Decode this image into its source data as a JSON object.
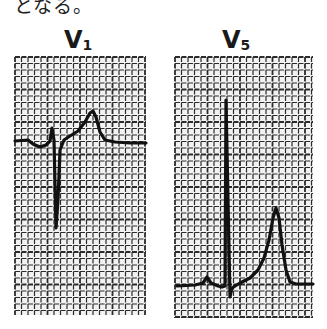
{
  "caption_fragment": "となる。",
  "panels": [
    {
      "lead": "V",
      "lead_sub": "1",
      "grid": {
        "x": 15,
        "y": 57,
        "width": 131,
        "height": 258,
        "spacing": 6.5
      },
      "trace_points": "15,141 28,140 33,144 40,147 46,145 50,141 52,128 54,140 56,228 58,200 60,150 64,140 70,136 78,131 85,122 90,113 93,111 96,117 100,132 105,140 115,142 130,143 146,143"
    },
    {
      "lead": "V",
      "lead_sub": "5",
      "grid": {
        "x": 175,
        "y": 57,
        "width": 138,
        "height": 261,
        "spacing": 6.5
      },
      "trace_points": "177,286 195,285 203,283 207,277 211,283 218,286 222,287 225,286 226,100 228,200 230,297 232,288 240,283 250,278 258,270 264,258 269,240 273,218 276,208 279,218 282,245 286,270 290,282 296,284 313,284"
    }
  ],
  "colors": {
    "grid_line": "#2b2b2b",
    "trace": "#111111",
    "paper": "#f2f2f2"
  }
}
